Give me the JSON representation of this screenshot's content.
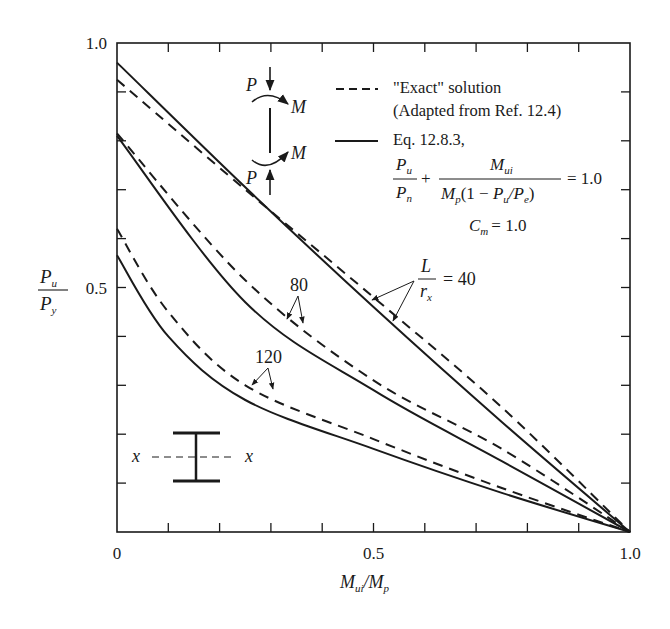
{
  "chart_data": {
    "type": "line",
    "title": "",
    "xlabel": "M_ui / M_p",
    "ylabel": "P_u / P_y",
    "xlim": [
      0,
      1.0
    ],
    "ylim": [
      0,
      1.0
    ],
    "x_major_ticks": [
      0,
      0.5,
      1.0
    ],
    "x_tick_labels": [
      "0",
      "0.5",
      "1.0"
    ],
    "x_minor_step": 0.1,
    "y_major_ticks": [
      0.5,
      1.0
    ],
    "y_tick_labels": [
      "0.5",
      "1.0"
    ],
    "y_minor_step": 0.1,
    "grid": false,
    "legend_position": "top-right",
    "legend": [
      {
        "style": "dashed",
        "lines": [
          "\"Exact\" solution",
          "(Adapted from Ref. 12.4)"
        ]
      },
      {
        "style": "solid",
        "lines": [
          "Eq. 12.8.3,"
        ]
      }
    ],
    "equation": {
      "lhs_num": "P_u",
      "lhs_den": "P_n",
      "rhs_num": "M_ui",
      "rhs_den": "M_p(1 − P_u/P_e)",
      "result": "= 1.0",
      "cm": "C_m = 1.0"
    },
    "annotations": [
      {
        "text": "L/r_x = 40",
        "targets": [
          "L/r=40 exact",
          "L/r=40 Eq. 12.8.3"
        ]
      },
      {
        "text": "80",
        "targets": [
          "L/r=80 exact",
          "L/r=80 Eq. 12.8.3"
        ]
      },
      {
        "text": "120",
        "targets": [
          "L/r=120 exact",
          "L/r=120 Eq. 12.8.3"
        ]
      }
    ],
    "series": [
      {
        "name": "L/r=40 Eq. 12.8.3",
        "slenderness": 40,
        "style": "solid",
        "x": [
          0,
          0.25,
          0.5,
          0.75,
          1.0
        ],
        "y": [
          0.96,
          0.705,
          0.46,
          0.225,
          0
        ]
      },
      {
        "name": "L/r=40 exact",
        "slenderness": 40,
        "style": "dashed",
        "x": [
          0,
          0.25,
          0.5,
          0.75,
          1.0
        ],
        "y": [
          0.925,
          0.7,
          0.48,
          0.255,
          0
        ]
      },
      {
        "name": "L/r=80 Eq. 12.8.3",
        "slenderness": 80,
        "style": "solid",
        "x": [
          0,
          0.25,
          0.5,
          0.75,
          1.0
        ],
        "y": [
          0.81,
          0.47,
          0.29,
          0.145,
          0
        ]
      },
      {
        "name": "L/r=80 exact",
        "slenderness": 80,
        "style": "dashed",
        "x": [
          0,
          0.25,
          0.5,
          0.75,
          1.0
        ],
        "y": [
          0.815,
          0.515,
          0.31,
          0.17,
          0
        ]
      },
      {
        "name": "L/r=120 Eq. 12.8.3",
        "slenderness": 120,
        "style": "solid",
        "x": [
          0,
          0.1,
          0.25,
          0.5,
          0.75,
          1.0
        ],
        "y": [
          0.566,
          0.4,
          0.27,
          0.17,
          0.08,
          0
        ]
      },
      {
        "name": "L/r=120 exact",
        "slenderness": 120,
        "style": "dashed",
        "x": [
          0,
          0.1,
          0.25,
          0.5,
          0.75,
          1.0
        ],
        "y": [
          0.62,
          0.45,
          0.3,
          0.19,
          0.09,
          0
        ]
      }
    ]
  },
  "labels": {
    "y_axis_num": "P",
    "y_axis_num_sub": "u",
    "y_axis_den": "P",
    "y_axis_den_sub": "y",
    "x_axis_main": "M",
    "x_axis_sub1": "ui",
    "x_axis_slash": "/M",
    "x_axis_sub2": "p",
    "legend_dashed_1": "\"Exact\" solution",
    "legend_dashed_2": "(Adapted from Ref. 12.4)",
    "legend_solid_1": "Eq. 12.8.3,",
    "eq_Pu": "P",
    "eq_u": "u",
    "eq_Pn": "P",
    "eq_n": "n",
    "eq_plus": "+",
    "eq_Mui": "M",
    "eq_ui": "ui",
    "eq_den_M": "M",
    "eq_den_p": "p",
    "eq_den_rest1": "(1 − ",
    "eq_den_P": "P",
    "eq_den_u": "u",
    "eq_den_slash": "/",
    "eq_den_P2": "P",
    "eq_den_e": "e",
    "eq_den_close": ")",
    "eq_result": "= 1.0",
    "cm_C": "C",
    "cm_sub": "m",
    "cm_val": "= 1.0",
    "ann40_L": "L",
    "ann40_r": "r",
    "ann40_x": "x",
    "ann40_val": "= 40",
    "ann80": "80",
    "ann120": "120",
    "diagram_P_top": "P",
    "diagram_M_top": "M",
    "diagram_M_bot": "M",
    "diagram_P_bot": "P",
    "section_x_left": "x",
    "section_x_right": "x"
  }
}
